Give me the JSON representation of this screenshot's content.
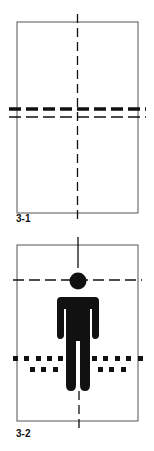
{
  "figures": [
    {
      "id": "3-1",
      "label": "3-1",
      "description": "Rectangle with vertical dash-dot center line and double horizontal dashed lines (thick upper, thin lower)"
    },
    {
      "id": "3-2",
      "label": "3-2",
      "description": "Rectangle with human figure pictogram, vertical dashed center line, horizontal dashed line at head level, and two rows of square dots at knee level"
    }
  ],
  "colors": {
    "line": "#111111",
    "frame": "#555555",
    "background": "#ffffff"
  }
}
